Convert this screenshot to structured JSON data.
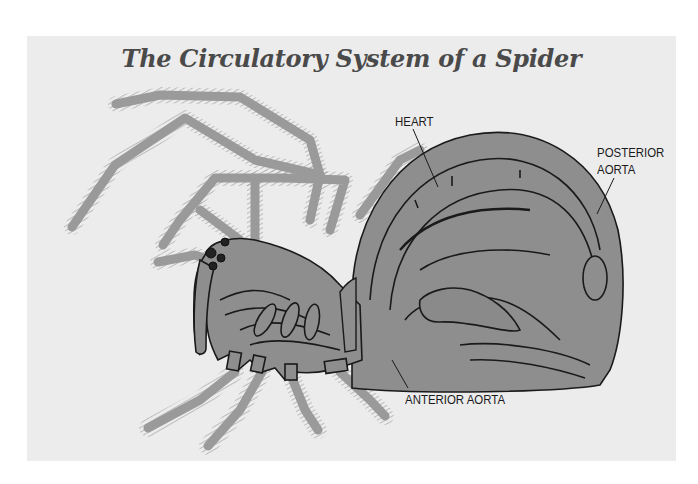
{
  "diagram": {
    "title": "The Circulatory System of a Spider",
    "subject": "spider",
    "labels": {
      "heart": "HEART",
      "posterior_aorta_line1": "POSTERIOR",
      "posterior_aorta_line2": "AORTA",
      "anterior_aorta": "ANTERIOR AORTA"
    },
    "colors": {
      "panel_background": "#ececec",
      "body_fill": "#8e8e8e",
      "leg_fill": "#9a9a9a",
      "outline": "#1a1a1a",
      "title_text": "#4a4a4a"
    }
  }
}
